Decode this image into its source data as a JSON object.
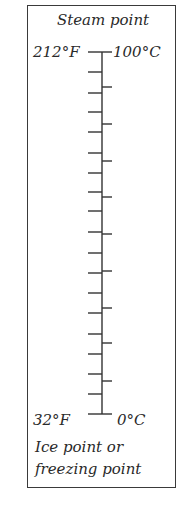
{
  "diagram": {
    "title_top": "Steam point",
    "top_left_label": "212°F",
    "top_right_label": "100°C",
    "bottom_left_label": "32°F",
    "bottom_right_label": "0°C",
    "caption_line1": "Ice point or",
    "caption_line2": "freezing point",
    "scale": {
      "fahrenheit_top": 212,
      "fahrenheit_bottom": 32,
      "celsius_top": 100,
      "celsius_bottom": 0,
      "left_tick_count": 17,
      "right_tick_count": 9
    },
    "line_color": "#333333"
  }
}
